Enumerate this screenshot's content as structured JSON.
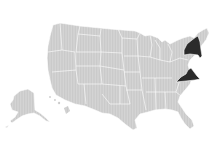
{
  "map": {
    "title": "United States",
    "highlighted_states": [
      "New York",
      "Virginia"
    ],
    "colors": {
      "base_fill": "#d2d2d2",
      "stripe": "#c4c4c4",
      "highlight_fill": "#2b2b2b",
      "border": "#ffffff",
      "background": "#ffffff"
    },
    "regions": [
      {
        "name": "Contiguous United States",
        "highlighted": false
      },
      {
        "name": "Alaska",
        "highlighted": false
      },
      {
        "name": "Hawaii",
        "highlighted": false
      },
      {
        "name": "New York",
        "highlighted": true
      },
      {
        "name": "Virginia",
        "highlighted": true
      }
    ]
  }
}
